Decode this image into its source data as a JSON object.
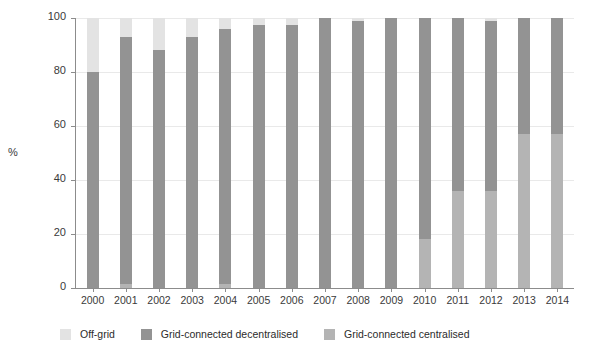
{
  "chart_data": {
    "type": "bar",
    "subtype": "stacked-bar-100",
    "title": "",
    "xlabel": "",
    "ylabel": "%",
    "ylim": [
      0,
      100
    ],
    "yticks": [
      0,
      20,
      40,
      60,
      80,
      100
    ],
    "ytick_labels": [
      "0",
      "20",
      "40",
      "60",
      "80",
      "100"
    ],
    "grid": true,
    "legend_position": "bottom",
    "categories": [
      "2000",
      "2001",
      "2002",
      "2003",
      "2004",
      "2005",
      "2006",
      "2007",
      "2008",
      "2009",
      "2010",
      "2011",
      "2012",
      "2013",
      "2014"
    ],
    "series": [
      {
        "name": "Grid-connected centralised",
        "color": "#b4b4b4",
        "values": [
          0,
          1.5,
          0,
          0,
          1.5,
          0,
          0,
          0,
          0,
          0,
          18,
          36,
          36,
          57,
          57
        ]
      },
      {
        "name": "Grid-connected decentralised",
        "color": "#939393",
        "values": [
          80,
          91.5,
          88,
          93,
          94.5,
          97.5,
          97.5,
          100,
          99,
          100,
          82,
          64,
          63,
          43,
          43
        ]
      },
      {
        "name": "Off-grid",
        "color": "#e3e3e3",
        "values": [
          20,
          7,
          12,
          7,
          4,
          2.5,
          2.5,
          0,
          1,
          0,
          0,
          0,
          1,
          0,
          0
        ]
      }
    ]
  },
  "axis": {
    "y_title": "%",
    "y_tick_labels": [
      "100",
      "80",
      "60",
      "40",
      "20",
      "0"
    ],
    "x_tick_labels": [
      "2000",
      "2001",
      "2002",
      "2003",
      "2004",
      "2005",
      "2006",
      "2007",
      "2008",
      "2009",
      "2010",
      "2011",
      "2012",
      "2013",
      "2014"
    ]
  },
  "legend": {
    "items": [
      {
        "label": "Off-grid",
        "color": "#e3e3e3",
        "swatch_name": "legend-swatch-off-grid"
      },
      {
        "label": "Grid-connected decentralised",
        "color": "#939393",
        "swatch_name": "legend-swatch-decentralised"
      },
      {
        "label": "Grid-connected centralised",
        "color": "#b4b4b4",
        "swatch_name": "legend-swatch-centralised"
      }
    ]
  }
}
